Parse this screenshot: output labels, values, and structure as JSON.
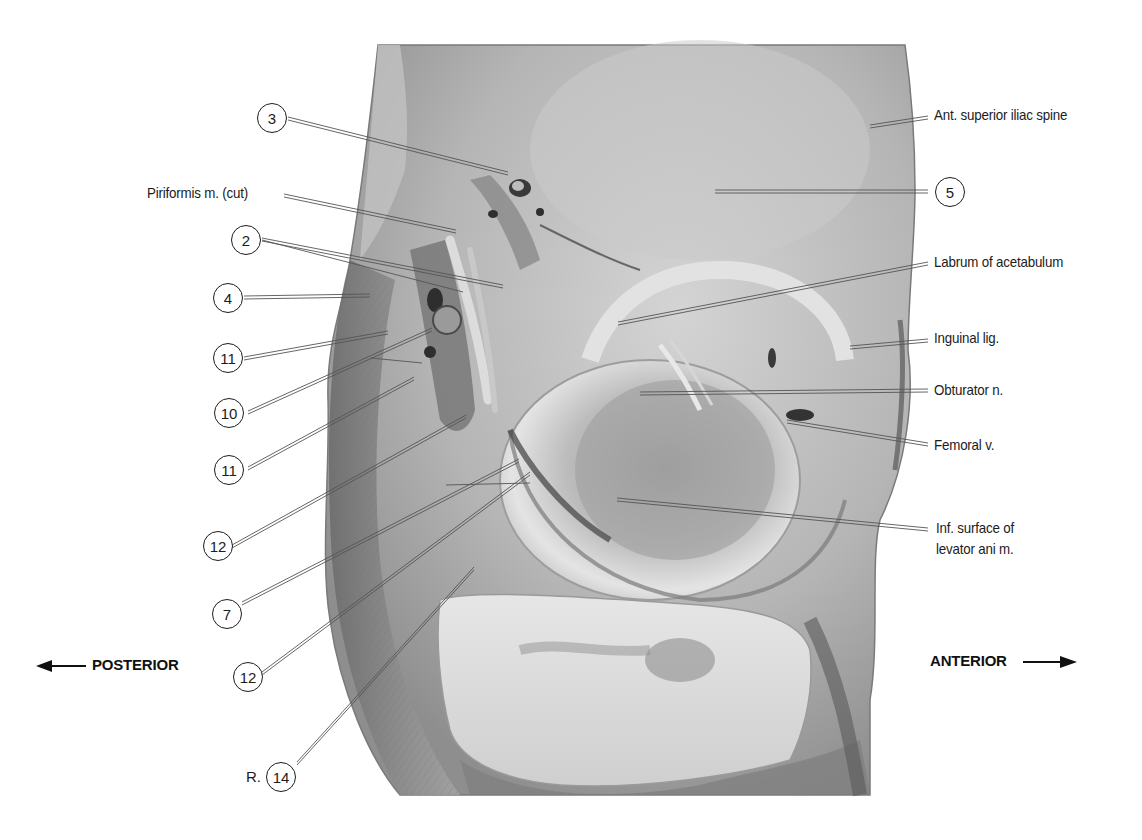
{
  "figure": {
    "type": "anatomical dissection photograph",
    "view": "Inferior/lateral view of perineum and hip region",
    "colors": {
      "background": "#ffffff",
      "specimen_mid": "#a8a8a8",
      "specimen_light": "#d8d8d8",
      "specimen_dark": "#5c5c5c",
      "leader": "#444444"
    }
  },
  "orientation": {
    "left": "POSTERIOR",
    "right": "ANTERIOR"
  },
  "labels": {
    "right": [
      {
        "text": "Ant. superior iliac spine"
      },
      {
        "text": "5",
        "circled": true
      },
      {
        "text": "Labrum of acetabulum"
      },
      {
        "text": "Inguinal lig."
      },
      {
        "text": "Obturator n."
      },
      {
        "text": "Femoral v."
      },
      {
        "text": "Inf. surface of",
        "line2": "levator ani m."
      }
    ],
    "left": [
      {
        "text": "3",
        "circled": true
      },
      {
        "text": "Piriformis m. (cut)"
      },
      {
        "text": "2",
        "circled": true
      },
      {
        "text": "4",
        "circled": true
      },
      {
        "text": "11",
        "circled": true
      },
      {
        "text": "10",
        "circled": true
      },
      {
        "text": "11",
        "circled": true
      },
      {
        "text": "12",
        "circled": true
      },
      {
        "text": "7",
        "circled": true
      },
      {
        "text": "12",
        "circled": true
      },
      {
        "text": "14",
        "circled": true,
        "prefix": "R."
      }
    ]
  }
}
